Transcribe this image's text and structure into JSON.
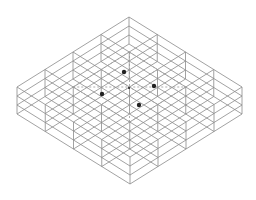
{
  "diagram": {
    "type": "isometric-wireframe-grid-box",
    "grid": {
      "cols": 4,
      "rows": 4
    },
    "wall_lines": 4,
    "colors": {
      "line": "#8a8a8a",
      "dashed": "#9a9a9a",
      "dot": "#222222",
      "background": "#ffffff"
    },
    "geometry": {
      "top": [
        129,
        17
      ],
      "right": [
        242,
        87
      ],
      "bottom": [
        129,
        157
      ],
      "left": [
        17,
        87
      ],
      "wall_height": 27
    },
    "dots": [
      {
        "x": 124,
        "y": 72,
        "r": 2.2
      },
      {
        "x": 154,
        "y": 86,
        "r": 2.2
      },
      {
        "x": 102,
        "y": 94,
        "r": 2.2
      },
      {
        "x": 139,
        "y": 105,
        "r": 2.2
      },
      {
        "x": 129,
        "y": 88,
        "r": 1.0
      }
    ]
  }
}
